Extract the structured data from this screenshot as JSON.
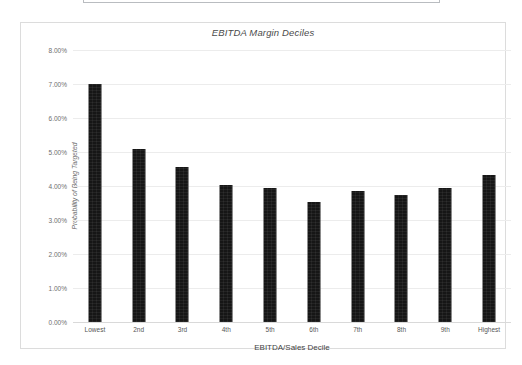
{
  "page": {
    "top_clipped_box": ""
  },
  "chart": {
    "title": "EBITDA Margin Deciles",
    "xlabel": "EBITDA/Sales Decile",
    "ylabel": "Probability of Being Targeted"
  },
  "chart_data": {
    "type": "bar",
    "title": "EBITDA Margin Deciles",
    "xlabel": "EBITDA/Sales Decile",
    "ylabel": "Probability of Being Targeted",
    "categories": [
      "Lowest",
      "2nd",
      "3rd",
      "4th",
      "5th",
      "6th",
      "7th",
      "8th",
      "9th",
      "Highest"
    ],
    "values": [
      7.0,
      5.1,
      4.55,
      4.02,
      3.95,
      3.52,
      3.85,
      3.75,
      3.95,
      4.32
    ],
    "value_unit": "%",
    "ylim": [
      0,
      8
    ],
    "ytick_values": [
      0,
      1,
      2,
      3,
      4,
      5,
      6,
      7,
      8
    ],
    "ytick_labels": [
      "0.00%",
      "1.00%",
      "2.00%",
      "3.00%",
      "4.00%",
      "5.00%",
      "6.00%",
      "7.00%",
      "8.00%"
    ],
    "grid": true,
    "legend": false,
    "bar_color": "#161616",
    "gridline_color": "#ececec"
  }
}
